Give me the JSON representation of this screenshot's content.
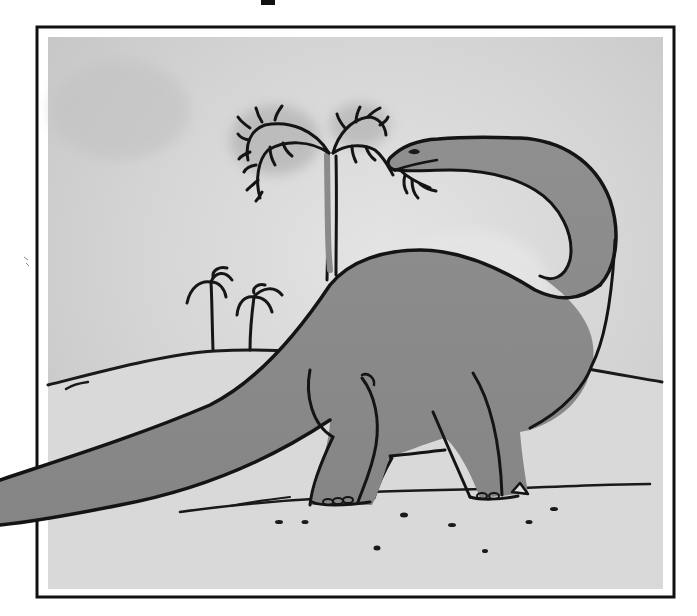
{
  "illustration": {
    "subject": "Brontosaurus eating leaves from a tall palm-like tree",
    "style": "grayscale watercolor with black crayon outlines",
    "colors": {
      "page_background": "#ffffff",
      "frame_stroke": "#111111",
      "sky": "#cfcfcf",
      "sky_light": "#e2e2e2",
      "ground": "#dcdcdc",
      "dinosaur_fill": "#8c8c8c",
      "dinosaur_shade": "#7a7a7a",
      "leg_shade": "#9a9a9a",
      "outline": "#141414",
      "foliage_halo": "#a9a9a9"
    },
    "elements": {
      "frame": "black rectangular border",
      "tall_tree": "tall thin tree with drooping fern-like fronds",
      "small_palms": "two small palm trees on a distant hill",
      "hill": "rolling hill line behind the dinosaur",
      "dinosaur": "long-necked sauropod with tail extending past the frame",
      "ground_pebbles": "scattered small dark pebbles"
    }
  }
}
